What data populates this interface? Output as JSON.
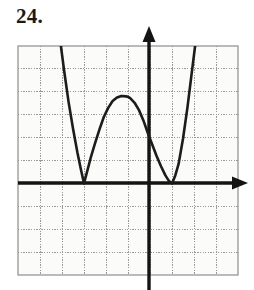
{
  "problem": {
    "number_label": "24."
  },
  "figure": {
    "kind": "coordinate-grid-graph",
    "background_color": "#ffffff",
    "grid_fill_color": "#fbfbfa",
    "grid_line_color": "#9a9a9a",
    "axis_color": "#141414",
    "curve_color": "#1c1c1c",
    "grid": {
      "left": 18,
      "top": 46,
      "right": 238,
      "bottom": 275,
      "columns": 10,
      "rows": 10,
      "cell_width": 22,
      "cell_height": 22.9,
      "show_grid": true
    },
    "axes": {
      "origin_x": 149,
      "origin_y": 183,
      "x_axis_arrow": "right",
      "y_axis_arrow": "up",
      "x_axis_label": "",
      "y_axis_label": "",
      "tick_labels_visible": false
    }
  },
  "chart_data": {
    "type": "line",
    "title": "",
    "subtitle": "",
    "xlabel": "",
    "ylabel": "",
    "grid": true,
    "legend": null,
    "xlim": [
      -6,
      4
    ],
    "ylim": [
      -4,
      6
    ],
    "annotations": [
      {
        "label": "left minimum (tangent to x-axis)",
        "x": -3,
        "y": 0
      },
      {
        "label": "local maximum",
        "x": -1,
        "y": 3.8
      },
      {
        "label": "right minimum (tangent to x-axis)",
        "x": 1,
        "y": 0
      }
    ],
    "series": [
      {
        "name": "curve",
        "x": [
          -4.05,
          -3.9,
          -3.7,
          -3.5,
          -3.3,
          -3.15,
          -3.0,
          -2.85,
          -2.7,
          -2.5,
          -2.3,
          -2.1,
          -1.9,
          -1.7,
          -1.5,
          -1.3,
          -1.1,
          -1.0,
          -0.9,
          -0.7,
          -0.5,
          -0.3,
          -0.1,
          0.1,
          0.3,
          0.5,
          0.7,
          0.85,
          1.0,
          1.15,
          1.3,
          1.5,
          1.7,
          1.9,
          2.05
        ],
        "y": [
          6.0,
          4.9,
          3.55,
          2.4,
          1.35,
          0.65,
          0.0,
          0.55,
          1.1,
          1.75,
          2.35,
          2.9,
          3.3,
          3.6,
          3.75,
          3.82,
          3.8,
          3.78,
          3.72,
          3.52,
          3.2,
          2.75,
          2.2,
          1.7,
          1.2,
          0.75,
          0.35,
          0.12,
          0.0,
          0.35,
          0.85,
          1.95,
          3.3,
          4.85,
          6.0
        ]
      }
    ]
  }
}
